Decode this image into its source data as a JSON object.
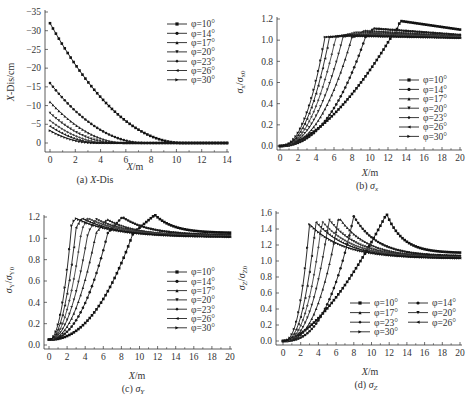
{
  "figure": {
    "panels": [
      {
        "id": "a",
        "caption": "(a)  X-Dis",
        "xlabel": "X/m",
        "ylabel": "X-Dis/cm"
      },
      {
        "id": "b",
        "caption": "(b)  σx",
        "xlabel": "X/m",
        "ylabel": "σx/σx0"
      },
      {
        "id": "c",
        "caption": "(c)  σY",
        "xlabel": "X/m",
        "ylabel": "σY/σY0"
      },
      {
        "id": "d",
        "caption": "(d)  σZ",
        "xlabel": "X/m",
        "ylabel": "σZ/σZ0"
      }
    ],
    "legend_labels": [
      "φ=10°",
      "φ=14°",
      "φ=17°",
      "φ=20°",
      "φ=23°",
      "φ=26°",
      "φ=30°"
    ]
  },
  "chart_data": [
    {
      "panel": "a",
      "type": "line",
      "title": "(a) X-Dis",
      "xlabel": "X/m",
      "ylabel": "X-Dis/cm",
      "xlim": [
        0,
        14
      ],
      "ylim": [
        -35,
        0
      ],
      "y_inverted": true,
      "xticks": [
        0,
        2,
        4,
        6,
        8,
        10,
        12,
        14
      ],
      "yticks": [
        0,
        -5,
        -10,
        -15,
        -20,
        -25,
        -30,
        -35
      ],
      "legend_position": "upper right",
      "grid": false,
      "series": [
        {
          "name": "φ=10°",
          "marker": "square",
          "start": -32.0,
          "zero_at": 10.5
        },
        {
          "name": "φ=14°",
          "marker": "circle",
          "start": -16.0,
          "zero_at": 7.5
        },
        {
          "name": "φ=17°",
          "marker": "triangle-up",
          "start": -11.0,
          "zero_at": 6.0
        },
        {
          "name": "φ=20°",
          "marker": "triangle-down",
          "start": -8.0,
          "zero_at": 5.2
        },
        {
          "name": "φ=23°",
          "marker": "diamond",
          "start": -6.0,
          "zero_at": 4.6
        },
        {
          "name": "φ=26°",
          "marker": "triangle-left",
          "start": -4.5,
          "zero_at": 4.0
        },
        {
          "name": "φ=30°",
          "marker": "triangle-right",
          "start": -3.3,
          "zero_at": 3.5
        }
      ]
    },
    {
      "panel": "b",
      "type": "line",
      "title": "(b) σx",
      "xlabel": "X/m",
      "ylabel": "σx/σx0",
      "xlim": [
        0,
        20
      ],
      "ylim": [
        0,
        1.2
      ],
      "xticks": [
        0,
        2,
        4,
        6,
        8,
        10,
        12,
        14,
        16,
        18,
        20
      ],
      "yticks": [
        0.0,
        0.2,
        0.4,
        0.6,
        0.8,
        1.0,
        1.2
      ],
      "legend_position": "center right",
      "grid": false,
      "series": [
        {
          "name": "φ=10°",
          "rise_mid": 9.5,
          "rise_end": 12.5,
          "peak": 1.18,
          "peak_x": 13.5,
          "end": 1.1
        },
        {
          "name": "φ=14°",
          "rise_mid": 7.0,
          "rise_end": 9.5,
          "peak": 1.11,
          "peak_x": 10.5,
          "end": 1.05
        },
        {
          "name": "φ=17°",
          "rise_mid": 5.8,
          "rise_end": 8.0,
          "peak": 1.09,
          "peak_x": 9.5,
          "end": 1.04
        },
        {
          "name": "φ=20°",
          "rise_mid": 5.0,
          "rise_end": 7.0,
          "peak": 1.07,
          "peak_x": 8.5,
          "end": 1.03
        },
        {
          "name": "φ=23°",
          "rise_mid": 4.3,
          "rise_end": 6.2,
          "peak": 1.06,
          "peak_x": 8.0,
          "end": 1.03
        },
        {
          "name": "φ=26°",
          "rise_mid": 3.8,
          "rise_end": 5.5,
          "peak": 1.05,
          "peak_x": 7.5,
          "end": 1.02
        },
        {
          "name": "φ=30°",
          "rise_mid": 3.3,
          "rise_end": 5.0,
          "peak": 1.04,
          "peak_x": 7.0,
          "end": 1.02
        }
      ]
    },
    {
      "panel": "c",
      "type": "line",
      "title": "(c) σY",
      "xlabel": "X/m",
      "ylabel": "σY/σY0",
      "xlim": [
        0,
        20
      ],
      "ylim": [
        0,
        1.2
      ],
      "xticks": [
        0,
        2,
        4,
        6,
        8,
        10,
        12,
        14,
        16,
        18,
        20
      ],
      "yticks": [
        0.0,
        0.2,
        0.4,
        0.6,
        0.8,
        1.0,
        1.2
      ],
      "legend_position": "center right",
      "grid": false,
      "series": [
        {
          "name": "φ=10°",
          "start": 0.05,
          "knee_x": 9.3,
          "knee_y": 1.05,
          "peak": 1.22,
          "peak_x": 11.7,
          "end": 1.05
        },
        {
          "name": "φ=14°",
          "start": 0.05,
          "knee_x": 6.5,
          "knee_y": 1.05,
          "peak": 1.2,
          "peak_x": 8.1,
          "end": 1.03
        },
        {
          "name": "φ=17°",
          "start": 0.05,
          "knee_x": 5.2,
          "knee_y": 1.05,
          "peak": 1.18,
          "peak_x": 6.4,
          "end": 1.02
        },
        {
          "name": "φ=20°",
          "start": 0.05,
          "knee_x": 4.3,
          "knee_y": 1.05,
          "peak": 1.18,
          "peak_x": 5.2,
          "end": 1.02
        },
        {
          "name": "φ=23°",
          "start": 0.05,
          "knee_x": 3.6,
          "knee_y": 1.08,
          "peak": 1.19,
          "peak_x": 4.3,
          "end": 1.02
        },
        {
          "name": "φ=26°",
          "start": 0.05,
          "knee_x": 3.0,
          "knee_y": 1.1,
          "peak": 1.19,
          "peak_x": 3.6,
          "end": 1.01
        },
        {
          "name": "φ=30°",
          "start": 0.05,
          "knee_x": 2.5,
          "knee_y": 1.12,
          "peak": 1.19,
          "peak_x": 2.9,
          "end": 1.01
        }
      ]
    },
    {
      "panel": "d",
      "type": "line",
      "title": "(d) σZ",
      "xlabel": "X/m",
      "ylabel": "σZ/σZ0",
      "xlim": [
        0,
        20
      ],
      "ylim": [
        0,
        1.6
      ],
      "xticks": [
        0,
        2,
        4,
        6,
        8,
        10,
        12,
        14,
        16,
        18,
        20
      ],
      "yticks": [
        0.0,
        0.2,
        0.4,
        0.6,
        0.8,
        1.0,
        1.2,
        1.4,
        1.6
      ],
      "legend_position": "lower right, two columns",
      "grid": false,
      "series": [
        {
          "name": "φ=10°",
          "start": 0.0,
          "peak": 1.59,
          "peak_x": 11.7,
          "end": 1.1
        },
        {
          "name": "φ=14°",
          "start": 0.0,
          "peak": 1.56,
          "peak_x": 8.0,
          "end": 1.06
        },
        {
          "name": "φ=17°",
          "start": 0.0,
          "peak": 1.55,
          "peak_x": 6.3,
          "end": 1.05
        },
        {
          "name": "φ=20°",
          "start": 0.0,
          "peak": 1.52,
          "peak_x": 5.2,
          "end": 1.04
        },
        {
          "name": "φ=23°",
          "start": 0.0,
          "peak": 1.5,
          "peak_x": 4.4,
          "end": 1.04
        },
        {
          "name": "φ=26°",
          "start": 0.0,
          "peak": 1.49,
          "peak_x": 3.7,
          "end": 1.03
        },
        {
          "name": "φ=30°",
          "start": 0.0,
          "peak": 1.46,
          "peak_x": 3.0,
          "end": 1.03
        }
      ]
    }
  ]
}
